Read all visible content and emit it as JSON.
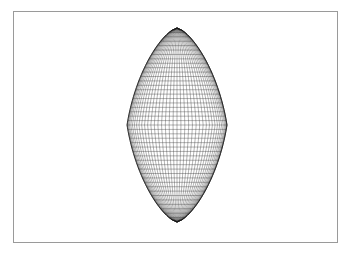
{
  "figure": {
    "background_color": "#ffffff",
    "frame": {
      "color": "#9a9a9a",
      "x": 13,
      "y": 11,
      "width": 325,
      "height": 232,
      "line_width": 1
    }
  },
  "chart_data": {
    "type": "line",
    "title": "",
    "subtitle": "",
    "xlabel": "",
    "ylabel": "",
    "render_style": "wireframe-mesh",
    "legend": [],
    "annotations": [],
    "grid": false,
    "axes_visible": false,
    "tick_labels_x": [],
    "tick_labels_y": [],
    "surface": {
      "center_x": 177,
      "center_y": 125,
      "half_width": 50,
      "half_height": 97,
      "apex_top": {
        "x": 177,
        "y": 28
      },
      "apex_bottom": {
        "x": 177,
        "y": 222
      },
      "equator_left": {
        "x": 127,
        "y": 125
      },
      "equator_right": {
        "x": 227,
        "y": 125
      },
      "profile_exponent": 0.62,
      "meridian_count": 40,
      "latitude_count": 44,
      "line_color": "#222222",
      "line_width": 0.35,
      "silhouette_color": "#111111",
      "silhouette_width": 0.8
    }
  }
}
